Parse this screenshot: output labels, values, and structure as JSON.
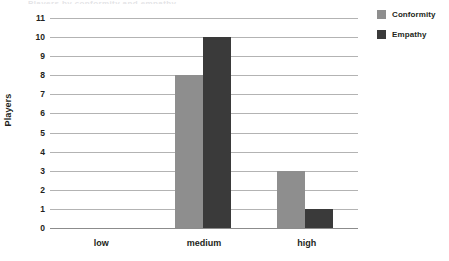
{
  "figure": {
    "width": 449,
    "height": 261,
    "background": "#ffffff",
    "title_remnant": "Players by conformity and empathy"
  },
  "chart_data": {
    "type": "bar",
    "title": "",
    "xlabel": "",
    "ylabel": "Players",
    "categories": [
      "low",
      "medium",
      "high"
    ],
    "series": [
      {
        "name": "Conformity",
        "color": "#8e8e8e",
        "values": [
          0,
          8,
          3
        ]
      },
      {
        "name": "Empathy",
        "color": "#3a3a3a",
        "values": [
          0,
          10,
          1
        ]
      }
    ],
    "ylim": [
      0,
      11
    ],
    "ytick_step": 1,
    "yticks": [
      11,
      10,
      9,
      8,
      7,
      6,
      5,
      4,
      3,
      2,
      1,
      0
    ],
    "grid": true,
    "grid_color": "#b3b3b3",
    "axis_color": "#8c8c8c",
    "legend_position": "top-right",
    "bar_group_mode": "grouped",
    "text_color": "#231f20"
  },
  "legend": {
    "items": [
      {
        "label": "Conformity",
        "color": "#8e8e8e"
      },
      {
        "label": "Empathy",
        "color": "#3a3a3a"
      }
    ]
  }
}
